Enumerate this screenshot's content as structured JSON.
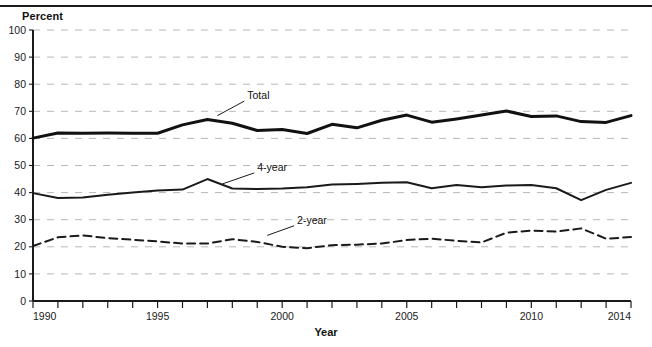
{
  "figure": {
    "clipped_header_text": "",
    "percent_axis_label": "Percent",
    "year_axis_label": "Year"
  },
  "chart_data": {
    "type": "line",
    "title": "",
    "subtitle": "",
    "xlabel": "Year",
    "ylabel": "Percent",
    "xlim": [
      1990,
      2014
    ],
    "ylim": [
      0,
      100
    ],
    "ytick_step": 10,
    "yticks": [
      0,
      10,
      20,
      30,
      40,
      50,
      60,
      70,
      80,
      90,
      100
    ],
    "ytick_labels": [
      "0",
      "10",
      "20",
      "30",
      "40",
      "50",
      "60",
      "70",
      "80",
      "90",
      "100"
    ],
    "xticks": [
      1990,
      1991,
      1992,
      1993,
      1994,
      1995,
      1996,
      1997,
      1998,
      1999,
      2000,
      2001,
      2002,
      2003,
      2004,
      2005,
      2006,
      2007,
      2008,
      2009,
      2010,
      2011,
      2012,
      2013,
      2014
    ],
    "xtick_labels_shown": [
      "1990",
      "1995",
      "2000",
      "2005",
      "2010",
      "2014"
    ],
    "xtick_labels_shown_at": [
      1990,
      1995,
      2000,
      2005,
      2010,
      2014
    ],
    "grid": "horizontal-dashed",
    "grid_color": "#b8b8b8",
    "legend_position": "inline-annotations",
    "x": [
      1990,
      1991,
      1992,
      1993,
      1994,
      1995,
      1996,
      1997,
      1998,
      1999,
      2000,
      2001,
      2002,
      2003,
      2004,
      2005,
      2006,
      2007,
      2008,
      2009,
      2010,
      2011,
      2012,
      2013,
      2014
    ],
    "series": [
      {
        "name": "Total",
        "label": "Total",
        "style": "solid",
        "color": "#111111",
        "width": 3.0,
        "values": [
          60.1,
          62.0,
          61.9,
          62.0,
          61.9,
          61.9,
          65.0,
          67.0,
          65.6,
          62.9,
          63.3,
          61.8,
          65.2,
          63.9,
          66.7,
          68.6,
          66.0,
          67.2,
          68.6,
          70.1,
          68.1,
          68.3,
          66.2,
          65.9,
          68.4
        ]
      },
      {
        "name": "4-year",
        "label": "4-year",
        "style": "solid",
        "color": "#1a1a1a",
        "width": 2.0,
        "values": [
          39.8,
          38.0,
          38.2,
          39.2,
          40.0,
          40.8,
          41.1,
          45.0,
          41.5,
          41.3,
          41.5,
          42.0,
          43.0,
          43.2,
          43.6,
          43.8,
          41.6,
          42.8,
          42.0,
          42.6,
          42.8,
          41.6,
          37.2,
          41.0,
          43.6
        ]
      },
      {
        "name": "2-year",
        "label": "2-year",
        "style": "dashed",
        "color": "#1a1a1a",
        "width": 2.0,
        "values": [
          20.3,
          23.5,
          24.2,
          23.2,
          22.6,
          22.0,
          21.2,
          21.2,
          22.8,
          21.8,
          20.0,
          19.5,
          20.6,
          20.8,
          21.2,
          22.5,
          23.0,
          22.2,
          21.6,
          25.2,
          26.0,
          25.6,
          26.8,
          23.0,
          23.6
        ]
      }
    ],
    "annotations": [
      {
        "text": "Total",
        "at_x": 1998.6,
        "at_y": 74.5,
        "leader_from_x": 1997.4,
        "leader_from_y": 68.4
      },
      {
        "text": "4-year",
        "at_x": 1999.0,
        "at_y": 48.0,
        "leader_from_x": 1997.6,
        "leader_from_y": 43.2
      },
      {
        "text": "2-year",
        "at_x": 2000.6,
        "at_y": 28.5,
        "leader_from_x": 1999.4,
        "leader_from_y": 24.2
      }
    ]
  }
}
